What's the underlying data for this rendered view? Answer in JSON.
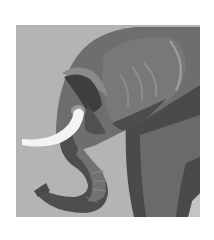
{
  "image": {
    "subject": "elephant-head-illustration",
    "style": "flat grayscale illustration",
    "colors": {
      "page_background": "#ffffff",
      "backdrop": "#b4b4b4",
      "head": "#6e6e6e",
      "shadow": "#464646",
      "ear": "#777777",
      "ear_ridges": "#9a9a9a",
      "tusk": "#f4f4f4",
      "trunk_dark": "#4c4c4c",
      "trunk_mid": "#707070"
    }
  }
}
